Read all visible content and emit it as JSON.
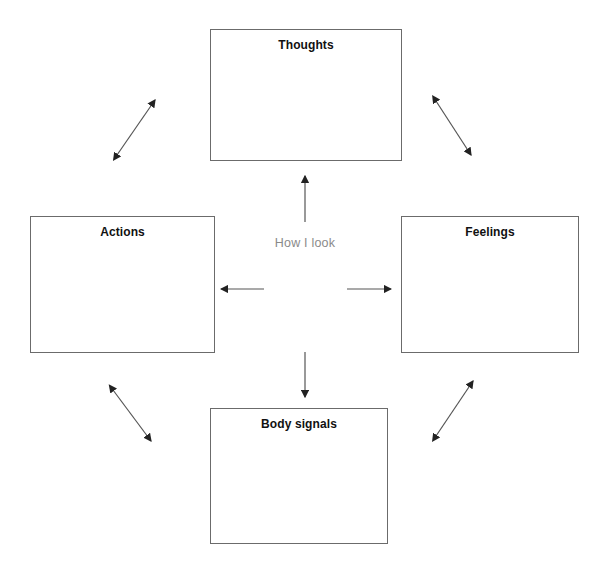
{
  "diagram": {
    "title_center": "How I look",
    "boxes": [
      {
        "id": "thoughts",
        "label": "Thoughts"
      },
      {
        "id": "actions",
        "label": "Actions"
      },
      {
        "id": "feelings",
        "label": "Feelings"
      },
      {
        "id": "body",
        "label": "Body signals"
      }
    ],
    "colors": {
      "box_border": "#6b6b6b",
      "box_fill": "#ffffff",
      "label_text": "#111111",
      "center_text": "#8a8a8a",
      "arrow": "#222222",
      "background": "#ffffff"
    },
    "arrows": {
      "center_up": "single-headed arrow pointing up to Thoughts",
      "center_down": "single-headed arrow pointing down to Body signals",
      "center_left": "single-headed arrow pointing left to Actions",
      "center_right": "single-headed arrow pointing right to Feelings",
      "corner_top_left": "double-headed diagonal arrow",
      "corner_top_right": "double-headed diagonal arrow",
      "corner_bottom_left": "double-headed diagonal arrow",
      "corner_bottom_right": "double-headed diagonal arrow"
    }
  }
}
